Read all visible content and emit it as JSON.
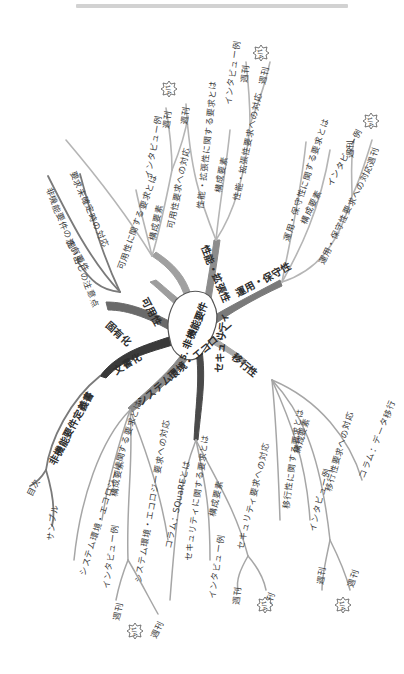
{
  "topbar": {
    "color": "#d2d2d2"
  },
  "center": {
    "number": "5.",
    "title": "非機能要件"
  },
  "colors": {
    "trunk": "#555555",
    "branch": "#9a9a9a",
    "twig": "#c4c4c4",
    "text": "#3b3b3b"
  },
  "branches": {
    "kaiyouka": {
      "label": "可用性",
      "children": [
        "可用性に関する要求とは",
        "構成要素",
        "可用性要求への対応",
        "インタビュー例",
        "週刊",
        "週刊"
      ]
    },
    "seinou": {
      "label": "性能・拡張性",
      "children": [
        "性能・拡張性に関する要求とは",
        "構成要素",
        "性能・拡張性要求への対応",
        "インタビュー例",
        "週刊",
        "週刊"
      ]
    },
    "unyou": {
      "label": "運用・保守性",
      "children": [
        "運用・保守性に関する要求とは",
        "構成要素",
        "インタビュー例",
        "運用・保守性要求への対応",
        "週刊",
        "週刊"
      ]
    },
    "ikousei": {
      "label": "移行性",
      "children": [
        "移行性に関する要求とは",
        "構成要素",
        "インタビュー例",
        "移行性要求への対応",
        "コラム：データ移行",
        "週刊",
        "週刊"
      ]
    },
    "security": {
      "label": "セキュリティ",
      "children": [
        "セキュリティに関する要求とは",
        "構成要素",
        "インタビュー例",
        "セキュリティ要求への対応",
        "週刊",
        "週刊"
      ]
    },
    "system": {
      "label": "システム環境・エコロジー",
      "children": [
        "システム環境・エコロジーに関する要求とは",
        "構成要素",
        "インタビュー例",
        "システム環境・エコロジー要求への対応",
        "コラム：SQuaREとは",
        "週刊",
        "週刊"
      ]
    },
    "bunshoka": {
      "label": "文書化",
      "children": [
        "非機能要件定義書",
        "目次",
        "サンプル"
      ]
    },
    "kotei": {
      "label": "固有化",
      "children": [
        "固有要件",
        "非機能要件の洗い出しの注意点",
        "要求未確定時の対応"
      ]
    }
  },
  "badges": {
    "label": "1/4"
  }
}
